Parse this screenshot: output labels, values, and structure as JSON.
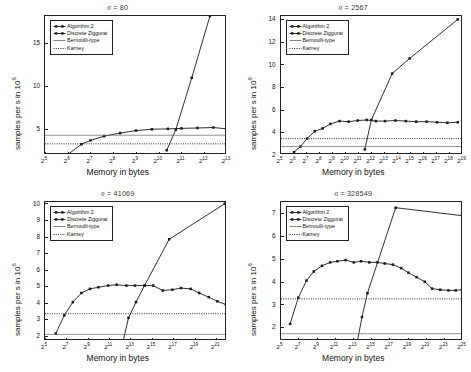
{
  "figure": {
    "xlabel": "Memory in bytes",
    "ylabel_main": "samples per s in",
    "ylabel_exp": "10",
    "ylabel_exp_sup": "6",
    "sigma_symbol": "σ",
    "equals": "="
  },
  "legend": {
    "items": [
      {
        "label": "Algorithm 2",
        "style": "line-markers",
        "color": "#1a1a1a"
      },
      {
        "label": "Discrete Ziggurat",
        "style": "line-markers",
        "color": "#1a1a1a"
      },
      {
        "label": "Bernoulli-type",
        "style": "solid-thin",
        "color": "#555555"
      },
      {
        "label": "Karney",
        "style": "dotted",
        "color": "#1a1a1a"
      }
    ]
  },
  "chart_data": [
    {
      "type": "line",
      "panel": "top-left",
      "title": "σ = 80",
      "sigma": 80,
      "xlabel": "Memory in bytes",
      "ylabel": "samples per s in 10^6",
      "xscale": "log2",
      "xlim": [
        5,
        13
      ],
      "ylim": [
        2.0,
        18.2
      ],
      "yticks": [
        5,
        10,
        15
      ],
      "xticks": [
        "2^5",
        "2^6",
        "2^7",
        "2^8",
        "2^9",
        "2^10",
        "2^11",
        "2^12",
        "2^13"
      ],
      "xtick_exponents": [
        5,
        6,
        7,
        8,
        9,
        10,
        11,
        12,
        13
      ],
      "grid": false,
      "legend_position": "upper-left",
      "series": [
        {
          "name": "Algorithm 2",
          "x": [
            6.0,
            6.6,
            7.0,
            7.6,
            8.3,
            9.0,
            9.7,
            10.4,
            11.0,
            11.7,
            12.4,
            13.0
          ],
          "y": [
            2.05,
            3.25,
            3.7,
            4.2,
            4.55,
            4.85,
            5.0,
            5.05,
            5.1,
            5.15,
            5.2,
            5.05
          ]
        },
        {
          "name": "Discrete Ziggurat",
          "x": [
            10.35,
            10.75,
            11.45,
            12.25
          ],
          "y": [
            2.55,
            4.95,
            11.0,
            18.2
          ]
        },
        {
          "name": "Bernoulli-type",
          "y_const": 4.3
        },
        {
          "name": "Karney",
          "y_const": 3.3
        }
      ]
    },
    {
      "type": "line",
      "panel": "top-right",
      "title": "σ = 2567",
      "sigma": 2567,
      "xlabel": "Memory in bytes",
      "ylabel": "samples per s in 10^6",
      "xscale": "log2",
      "xlim": [
        5,
        19
      ],
      "ylim": [
        2.0,
        14.3
      ],
      "yticks": [
        2,
        4,
        6,
        8,
        10,
        12,
        14
      ],
      "xticks": [
        "2^5",
        "2^6",
        "2^7",
        "2^8",
        "2^9",
        "2^10",
        "2^11",
        "2^12",
        "2^13",
        "2^14",
        "2^15",
        "2^16",
        "2^17",
        "2^18",
        "2^19"
      ],
      "xtick_exponents": [
        5,
        6,
        7,
        8,
        9,
        10,
        11,
        12,
        13,
        14,
        15,
        16,
        17,
        18,
        19
      ],
      "grid": false,
      "legend_position": "upper-left",
      "series": [
        {
          "name": "Algorithm 2",
          "x": [
            6.0,
            6.5,
            7.0,
            7.6,
            8.2,
            8.8,
            9.5,
            10.2,
            10.9,
            11.6,
            12.3,
            13.0,
            13.8,
            14.6,
            15.4,
            16.2,
            17.0,
            17.8,
            18.6
          ],
          "y": [
            2.25,
            2.75,
            3.45,
            4.1,
            4.35,
            4.75,
            5.0,
            4.95,
            5.05,
            5.1,
            5.0,
            5.0,
            5.05,
            5.0,
            4.95,
            4.95,
            4.9,
            4.85,
            4.9
          ]
        },
        {
          "name": "Discrete Ziggurat",
          "x": [
            11.45,
            11.95,
            13.55,
            14.9,
            18.6
          ],
          "y": [
            2.5,
            5.1,
            9.2,
            10.55,
            14.0
          ]
        },
        {
          "name": "Bernoulli-type",
          "y_const": 2.75
        },
        {
          "name": "Karney",
          "y_const": 3.45
        }
      ]
    },
    {
      "type": "line",
      "panel": "bottom-left",
      "title": "σ = 41069",
      "sigma": 41069,
      "xlabel": "Memory in bytes",
      "ylabel": "samples per s in 10^6",
      "xscale": "log2",
      "xlim": [
        5,
        22
      ],
      "ylim": [
        1.7,
        10.1
      ],
      "yticks": [
        2,
        3,
        4,
        5,
        6,
        7,
        8,
        9,
        10
      ],
      "xticks": [
        "2^5",
        "2^7",
        "2^9",
        "2^11",
        "2^13",
        "2^15",
        "2^17",
        "2^19",
        "2^21"
      ],
      "xtick_exponents": [
        5,
        7,
        9,
        11,
        13,
        15,
        17,
        19,
        21
      ],
      "grid": false,
      "legend_position": "upper-left",
      "series": [
        {
          "name": "Algorithm 2",
          "x": [
            6.0,
            6.8,
            7.6,
            8.4,
            9.2,
            10.0,
            10.9,
            11.7,
            12.6,
            13.4,
            14.3,
            15.1,
            16.0,
            16.9,
            17.7,
            18.6,
            19.4,
            20.3,
            21.1,
            21.9
          ],
          "y": [
            2.15,
            3.25,
            4.05,
            4.6,
            4.85,
            4.95,
            5.05,
            5.1,
            5.05,
            5.05,
            5.05,
            5.05,
            4.75,
            4.8,
            4.9,
            4.85,
            4.6,
            4.35,
            4.1,
            3.9
          ]
        },
        {
          "name": "Discrete Ziggurat",
          "x": [
            12.3,
            12.8,
            13.5,
            14.3,
            16.6,
            21.8
          ],
          "y": [
            1.7,
            3.1,
            4.05,
            5.05,
            7.85,
            10.0
          ]
        },
        {
          "name": "Bernoulli-type",
          "y_const": 2.1
        },
        {
          "name": "Karney",
          "y_const": 3.35
        }
      ]
    },
    {
      "type": "line",
      "panel": "bottom-right",
      "title": "σ = 328549",
      "sigma": 328549,
      "xlabel": "Memory in bytes",
      "ylabel": "samples per s in 10^6",
      "xscale": "log2",
      "xlim": [
        5,
        25
      ],
      "ylim": [
        1.4,
        7.5
      ],
      "yticks": [
        2,
        3,
        4,
        5,
        6,
        7
      ],
      "xticks": [
        "2^5",
        "2^7",
        "2^9",
        "2^11",
        "2^13",
        "2^15",
        "2^17",
        "2^19",
        "2^21",
        "2^23",
        "2^25"
      ],
      "xtick_exponents": [
        5,
        7,
        9,
        11,
        13,
        15,
        17,
        19,
        21,
        23,
        25
      ],
      "grid": false,
      "legend_position": "upper-left",
      "series": [
        {
          "name": "Algorithm 2",
          "x": [
            6.0,
            6.9,
            7.8,
            8.6,
            9.5,
            10.4,
            11.2,
            12.1,
            13.0,
            13.8,
            14.7,
            15.6,
            16.4,
            17.3,
            18.2,
            19.0,
            19.9,
            20.8,
            21.6,
            22.5,
            23.4,
            24.2,
            24.9
          ],
          "y": [
            2.15,
            3.3,
            4.05,
            4.45,
            4.7,
            4.85,
            4.9,
            4.95,
            4.85,
            4.9,
            4.85,
            4.85,
            4.8,
            4.75,
            4.6,
            4.4,
            4.2,
            4.0,
            3.7,
            3.65,
            3.62,
            3.62,
            3.65
          ]
        },
        {
          "name": "Discrete Ziggurat",
          "x": [
            13.4,
            13.9,
            14.5,
            17.6,
            24.9
          ],
          "y": [
            1.4,
            2.45,
            3.5,
            7.25,
            6.9
          ]
        },
        {
          "name": "Bernoulli-type",
          "y_const": 1.72
        },
        {
          "name": "Karney",
          "y_const": 3.25
        }
      ]
    }
  ]
}
